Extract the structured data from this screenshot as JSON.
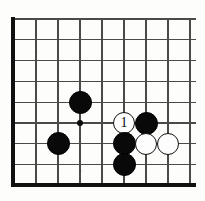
{
  "figure": {
    "kind": "go-board-diagram",
    "board": {
      "columns": 9,
      "rows": 9,
      "origin_x": 14,
      "origin_y": 19,
      "col_spacing": 22.0,
      "row_spacing": 20.8,
      "line_color": "#4a4a4a",
      "edge_color": "#101010",
      "edge_thickness": 4,
      "line_thickness": 1.2,
      "background_color": "#fdfdfc",
      "edges": [
        "left",
        "bottom"
      ]
    },
    "hoshi_points": [
      {
        "name": "star-point",
        "col": 3,
        "row": 5,
        "radius": 3.2
      }
    ],
    "stones": [
      {
        "name": "black-stone-upper-left-area",
        "color": "black",
        "col": 3,
        "row": 4,
        "radius": 11.5,
        "label": ""
      },
      {
        "name": "black-stone-lower-left-area",
        "color": "black",
        "col": 2,
        "row": 6,
        "radius": 11.5,
        "label": ""
      },
      {
        "name": "white-stone-move-1",
        "color": "white",
        "col": 5,
        "row": 5,
        "radius": 11.0,
        "label": "1"
      },
      {
        "name": "black-stone-right-of-move",
        "color": "black",
        "col": 6,
        "row": 5,
        "radius": 11.5,
        "label": ""
      },
      {
        "name": "black-stone-below-move",
        "color": "black",
        "col": 5,
        "row": 6,
        "radius": 11.5,
        "label": ""
      },
      {
        "name": "white-stone-center-right",
        "color": "white",
        "col": 6,
        "row": 6,
        "radius": 11.0,
        "label": ""
      },
      {
        "name": "white-stone-far-right",
        "color": "white",
        "col": 7,
        "row": 6,
        "radius": 11.0,
        "label": ""
      },
      {
        "name": "black-stone-bottom",
        "color": "black",
        "col": 5,
        "row": 7,
        "radius": 11.5,
        "label": ""
      }
    ],
    "move_numbers": [
      "1"
    ]
  }
}
